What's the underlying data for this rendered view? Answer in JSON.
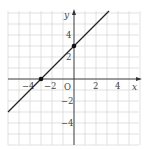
{
  "diagram": {
    "type": "coordinate-plane-line-graph",
    "x_axis_label": "x",
    "y_axis_label": "y",
    "origin_label": "O",
    "x_range": [
      -6,
      6
    ],
    "y_range": [
      -6,
      6
    ],
    "grid_step": 1,
    "x_tick_labels": [
      {
        "value": -4,
        "text": "−4"
      },
      {
        "value": -2,
        "text": "−2"
      },
      {
        "value": 2,
        "text": "2"
      },
      {
        "value": 4,
        "text": "4"
      }
    ],
    "y_tick_labels": [
      {
        "value": 4,
        "text": "4"
      },
      {
        "value": 2,
        "text": "2"
      },
      {
        "value": -2,
        "text": "−2"
      },
      {
        "value": -4,
        "text": "−4"
      }
    ],
    "line": {
      "slope": 1,
      "intercept": 3,
      "color": "#222222"
    },
    "points": [
      {
        "name": "x-intercept",
        "x": -3,
        "y": 0
      },
      {
        "name": "y-intercept",
        "x": 0,
        "y": 3
      }
    ],
    "colors": {
      "grid": "#d4d4d4",
      "axis": "#333333",
      "text": "#444444"
    }
  }
}
